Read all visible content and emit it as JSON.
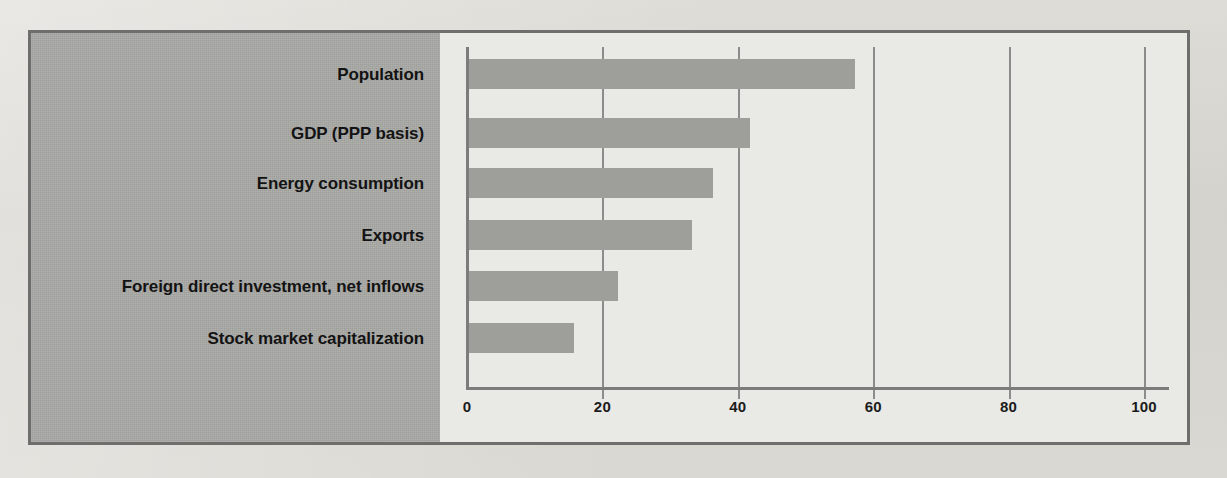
{
  "figure": {
    "accent_color": "#9e9e9b",
    "panel_color": "#a8a8a5",
    "frame_color": "#6e6e6c",
    "plot_background": "#e9e9e5"
  },
  "background_ghost_text": [
    "by Chinese",
    "economic",
    "trade, the competition",
    "to access to the",
    "larger economy.",
    "almost entirely",
    "to rapid, it also means"
  ],
  "chart_data": {
    "type": "bar",
    "orientation": "horizontal",
    "title": "",
    "xlabel": "",
    "ylabel": "",
    "xlim": [
      0,
      100
    ],
    "xticks": [
      0,
      20,
      40,
      60,
      80,
      100
    ],
    "xtick_labels": [
      "0",
      "20",
      "40",
      "60",
      "80",
      "100"
    ],
    "grid": true,
    "grid_axis": "x",
    "legend": false,
    "categories": [
      "Population",
      "GDP (PPP basis)",
      "Energy consumption",
      "Exports",
      "Foreign direct investment, net inflows",
      "Stock market capitalization"
    ],
    "values": [
      57,
      41.5,
      36,
      33,
      22,
      15.5
    ],
    "series": [
      {
        "name": "Share",
        "values": [
          57,
          41.5,
          36,
          33,
          22,
          15.5
        ]
      }
    ]
  }
}
